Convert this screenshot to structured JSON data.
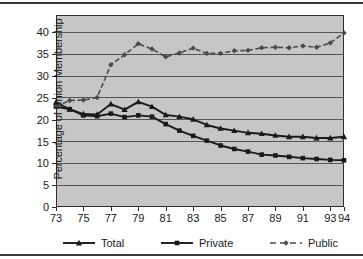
{
  "chart_data": {
    "type": "line",
    "title": "",
    "subtitle": "",
    "xlabel": "",
    "ylabel": "Percentage of Union Membership",
    "xlim": [
      73,
      94
    ],
    "ylim": [
      0,
      44
    ],
    "yticks": [
      0,
      5,
      10,
      15,
      20,
      25,
      30,
      35,
      40
    ],
    "ytick_labels": [
      "0",
      "5",
      "10",
      "15",
      "20",
      "25",
      "30",
      "35",
      "40"
    ],
    "xticks": [
      73,
      75,
      77,
      79,
      81,
      83,
      85,
      87,
      89,
      91,
      93,
      94
    ],
    "xtick_labels": [
      "73",
      "75",
      "77",
      "79",
      "81",
      "83",
      "85",
      "87",
      "89",
      "91",
      "93",
      "94"
    ],
    "x": [
      73,
      74,
      75,
      76,
      77,
      78,
      79,
      80,
      81,
      82,
      83,
      84,
      85,
      86,
      87,
      88,
      89,
      90,
      91,
      92,
      93,
      94
    ],
    "grid": "horizontal",
    "legend_position": "bottom",
    "plot_background": "#c6c6c6",
    "series": [
      {
        "name": "Total",
        "marker": "triangle",
        "line_style": "solid",
        "color": "#1a1a1a",
        "values": [
          24.0,
          22.4,
          21.3,
          21.2,
          23.6,
          22.3,
          24.1,
          23.0,
          21.1,
          20.7,
          20.1,
          18.8,
          18.0,
          17.5,
          17.0,
          16.8,
          16.4,
          16.1,
          16.1,
          15.8,
          15.8,
          16.1
        ]
      },
      {
        "name": "Private",
        "marker": "square",
        "line_style": "solid",
        "color": "#1a1a1a",
        "values": [
          23.0,
          22.4,
          21.0,
          20.8,
          21.4,
          20.6,
          21.0,
          20.7,
          19.0,
          17.5,
          16.3,
          15.2,
          14.1,
          13.3,
          12.7,
          12.0,
          11.8,
          11.5,
          11.2,
          11.0,
          10.8,
          10.7
        ]
      },
      {
        "name": "Public",
        "marker": "diamond",
        "line_style": "dashed",
        "color": "#4a4a4a",
        "values": [
          23.0,
          24.4,
          24.5,
          25.1,
          32.6,
          34.9,
          37.4,
          36.2,
          34.4,
          35.3,
          36.4,
          35.2,
          35.2,
          35.8,
          35.9,
          36.5,
          36.6,
          36.5,
          36.9,
          36.6,
          37.6,
          39.9
        ]
      }
    ]
  },
  "legend": {
    "items": [
      {
        "label": "Total",
        "marker": "triangle",
        "line_style": "solid"
      },
      {
        "label": "Private",
        "marker": "square",
        "line_style": "solid"
      },
      {
        "label": "Public",
        "marker": "diamond",
        "line_style": "dashed"
      }
    ]
  },
  "colors": {
    "plot_background": "#c6c6c6",
    "page_background": "#ffffff",
    "axis": "#2c2c2c",
    "gridline": "#555555",
    "text": "#1a1a1a",
    "series_dark": "#1a1a1a",
    "series_gray": "#4a4a4a",
    "frame_rule": "#3a3a3a"
  }
}
